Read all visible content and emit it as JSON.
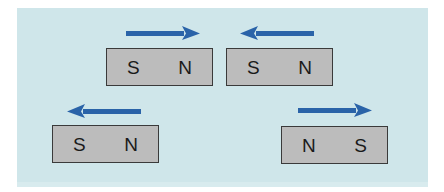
{
  "diagram": {
    "title": "",
    "background_color": "#cfe6ea",
    "magnet_color": "#bcbcbc",
    "arrow_color": "#2a63a8",
    "magnets": [
      {
        "id": "magnet-1",
        "left_pole": "S",
        "right_pole": "N",
        "arrow_direction": "right"
      },
      {
        "id": "magnet-2",
        "left_pole": "S",
        "right_pole": "N",
        "arrow_direction": "left"
      },
      {
        "id": "magnet-3",
        "left_pole": "S",
        "right_pole": "N",
        "arrow_direction": "left"
      },
      {
        "id": "magnet-4",
        "left_pole": "N",
        "right_pole": "S",
        "arrow_direction": "right"
      }
    ]
  }
}
